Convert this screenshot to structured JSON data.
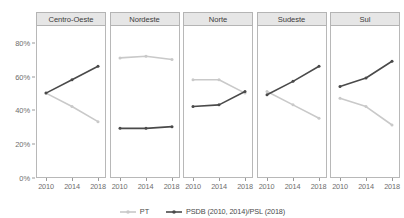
{
  "chart_data": {
    "type": "line",
    "title": "",
    "xlabel": "",
    "ylabel": "",
    "x": [
      2010,
      2014,
      2018
    ],
    "xtick_labels": [
      "2010",
      "2014",
      "2018"
    ],
    "ytick_labels": [
      "0%",
      "20%",
      "40%",
      "60%",
      "80%"
    ],
    "ytick_values": [
      0,
      20,
      40,
      60,
      80
    ],
    "ylim": [
      0,
      90
    ],
    "grid": false,
    "legend_position": "bottom-center",
    "facet_variable": "region",
    "panels": [
      {
        "label": "Centro-Oeste",
        "series": [
          {
            "name": "PT",
            "values": [
              50,
              42,
              33
            ]
          },
          {
            "name": "PSDB (2010, 2014)/PSL (2018)",
            "values": [
              50,
              58,
              66
            ]
          }
        ]
      },
      {
        "label": "Nordeste",
        "series": [
          {
            "name": "PT",
            "values": [
              71,
              72,
              70
            ]
          },
          {
            "name": "PSDB (2010, 2014)/PSL (2018)",
            "values": [
              29,
              29,
              30
            ]
          }
        ]
      },
      {
        "label": "Norte",
        "series": [
          {
            "name": "PT",
            "values": [
              58,
              58,
              50
            ]
          },
          {
            "name": "PSDB (2010, 2014)/PSL (2018)",
            "values": [
              42,
              43,
              51
            ]
          }
        ]
      },
      {
        "label": "Sudeste",
        "series": [
          {
            "name": "PT",
            "values": [
              51,
              43,
              35
            ]
          },
          {
            "name": "PSDB (2010, 2014)/PSL (2018)",
            "values": [
              49,
              57,
              66
            ]
          }
        ]
      },
      {
        "label": "Sul",
        "series": [
          {
            "name": "PT",
            "values": [
              47,
              42,
              31
            ]
          },
          {
            "name": "PSDB (2010, 2014)/PSL (2018)",
            "values": [
              54,
              59,
              69
            ]
          }
        ]
      }
    ],
    "legend": [
      {
        "label": "PT",
        "color": "#c9c9c9"
      },
      {
        "label": "PSDB (2010, 2014)/PSL (2018)",
        "color": "#4a4a4a"
      }
    ],
    "colors": {
      "pt": "#c9c9c9",
      "psdb_psl": "#4a4a4a",
      "axis": "#9a9a9a",
      "panel_header_bg": "#e6e6e6",
      "panel_border": "#b8b8b8",
      "text": "#6e6e6e"
    }
  }
}
